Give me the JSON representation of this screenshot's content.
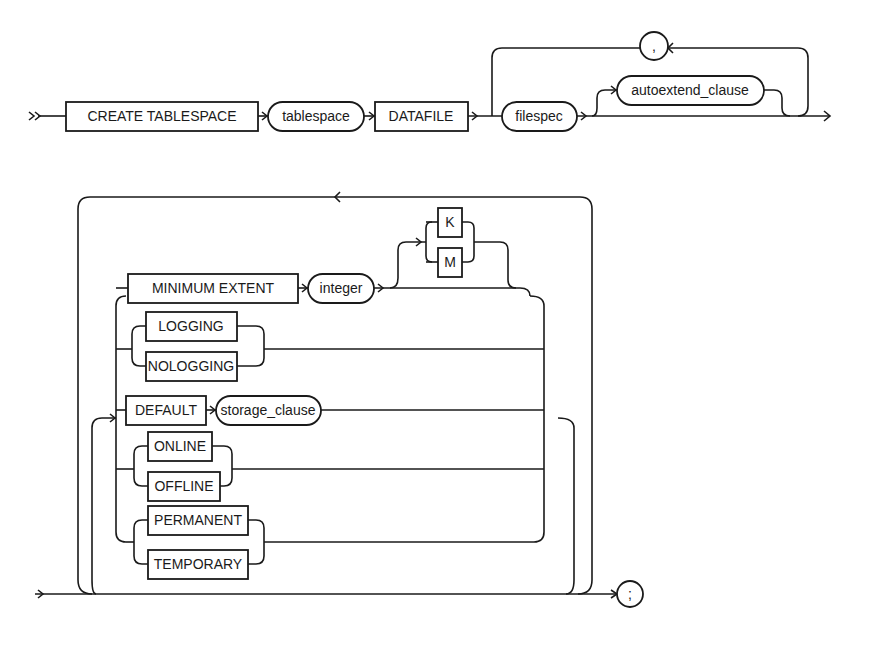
{
  "diagram": {
    "main_row": {
      "keyword_create_tablespace": "CREATE TABLESPACE",
      "param_tablespace": "tablespace",
      "keyword_datafile": "DATAFILE",
      "param_filespec": "filespec",
      "param_autoextend_clause": "autoextend_clause",
      "separator_comma": ","
    },
    "options_loop": {
      "minimum_extent": {
        "keyword": "MINIMUM EXTENT",
        "param": "integer",
        "units": [
          "K",
          "M"
        ]
      },
      "logging_choice": [
        "LOGGING",
        "NOLOGGING"
      ],
      "default_storage": {
        "keyword": "DEFAULT",
        "param": "storage_clause"
      },
      "online_choice": [
        "ONLINE",
        "OFFLINE"
      ],
      "permanence_choice": [
        "PERMANENT",
        "TEMPORARY"
      ]
    },
    "terminator": ";"
  }
}
